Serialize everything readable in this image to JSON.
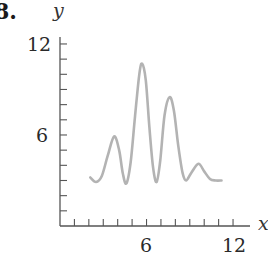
{
  "problem": {
    "number_label": "8."
  },
  "chart_data": {
    "type": "line",
    "title": "",
    "xlabel": "x",
    "ylabel": "y",
    "xlim": [
      0,
      13
    ],
    "ylim": [
      0,
      12
    ],
    "x_ticks": [
      1,
      2,
      3,
      4,
      5,
      6,
      7,
      8,
      9,
      10,
      11,
      12
    ],
    "y_ticks": [
      1,
      2,
      3,
      4,
      5,
      6,
      7,
      8,
      9,
      10,
      11,
      12
    ],
    "x_tick_labels": [
      {
        "value": 6,
        "label": "6"
      },
      {
        "value": 12,
        "label": "12"
      }
    ],
    "y_tick_labels": [
      {
        "value": 6,
        "label": "6"
      },
      {
        "value": 12,
        "label": "12"
      }
    ],
    "grid": false,
    "legend": null,
    "series": [
      {
        "name": "y(x)",
        "color": "#b3b3b3",
        "points": [
          [
            2.1,
            3.2
          ],
          [
            2.5,
            2.9
          ],
          [
            2.9,
            3.3
          ],
          [
            3.3,
            4.6
          ],
          [
            3.75,
            5.9
          ],
          [
            4.1,
            5.0
          ],
          [
            4.35,
            3.5
          ],
          [
            4.6,
            2.8
          ],
          [
            4.9,
            4.2
          ],
          [
            5.2,
            7.2
          ],
          [
            5.5,
            10.0
          ],
          [
            5.7,
            10.7
          ],
          [
            5.95,
            9.6
          ],
          [
            6.2,
            6.5
          ],
          [
            6.45,
            3.9
          ],
          [
            6.7,
            2.9
          ],
          [
            6.95,
            4.3
          ],
          [
            7.25,
            7.3
          ],
          [
            7.6,
            8.5
          ],
          [
            7.9,
            7.6
          ],
          [
            8.2,
            5.3
          ],
          [
            8.5,
            3.5
          ],
          [
            8.75,
            3.0
          ],
          [
            9.1,
            3.5
          ],
          [
            9.6,
            4.1
          ],
          [
            10.0,
            3.6
          ],
          [
            10.4,
            3.1
          ],
          [
            10.8,
            3.0
          ],
          [
            11.2,
            3.0
          ]
        ]
      }
    ]
  },
  "colors": {
    "axis": "#555555",
    "curve": "#b3b3b3",
    "text": "#2a2a2a"
  }
}
